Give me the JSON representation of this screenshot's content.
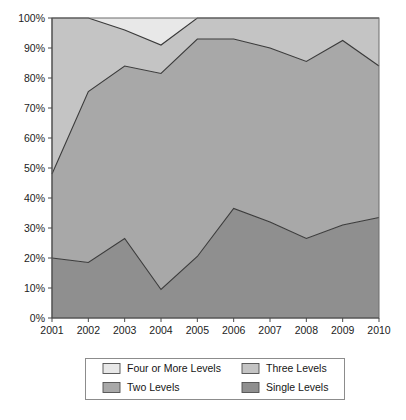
{
  "chart_data": {
    "type": "area",
    "stacked": true,
    "stack_mode": "percent",
    "title": "",
    "subtitle": "",
    "xlabel": "",
    "ylabel": "",
    "grid": false,
    "legend_position": "bottom",
    "categories": [
      "2001",
      "2002",
      "2003",
      "2004",
      "2005",
      "2006",
      "2007",
      "2008",
      "2009",
      "2010"
    ],
    "x_tick_labels": [
      "2001",
      "2002",
      "2003",
      "2004",
      "2005",
      "2006",
      "2007",
      "2008",
      "2009",
      "2010"
    ],
    "y_tick_labels": [
      "0%",
      "10%",
      "20%",
      "30%",
      "40%",
      "50%",
      "60%",
      "70%",
      "80%",
      "90%",
      "100%"
    ],
    "y_tick_values": [
      0,
      10,
      20,
      30,
      40,
      50,
      60,
      70,
      80,
      90,
      100
    ],
    "ylim": [
      0,
      100
    ],
    "y_unit": "%",
    "series": [
      {
        "name": "Single Levels",
        "color": "#8f8f8f",
        "values": [
          20.0,
          18.5,
          26.5,
          9.5,
          20.5,
          36.5,
          32.0,
          26.5,
          31.0,
          33.5
        ],
        "cumulative_top": [
          20.0,
          18.5,
          26.5,
          9.5,
          20.5,
          36.5,
          32.0,
          26.5,
          31.0,
          33.5
        ]
      },
      {
        "name": "Two Levels",
        "color": "#a8a8a8",
        "values": [
          28.0,
          57.0,
          57.5,
          72.0,
          72.5,
          56.5,
          58.0,
          59.0,
          61.5,
          50.5
        ],
        "cumulative_top": [
          48.0,
          75.5,
          84.0,
          81.5,
          93.0,
          93.0,
          90.0,
          85.5,
          92.5,
          84.0
        ]
      },
      {
        "name": "Three Levels",
        "color": "#c4c4c4",
        "values": [
          52.0,
          24.5,
          12.0,
          9.5,
          7.0,
          7.0,
          10.0,
          14.5,
          7.5,
          16.0
        ],
        "cumulative_top": [
          100.0,
          100.0,
          96.0,
          91.0,
          100.0,
          100.0,
          100.0,
          100.0,
          100.0,
          100.0
        ]
      },
      {
        "name": "Four or More Levels",
        "color": "#e8e8e8",
        "values": [
          0.0,
          0.0,
          4.0,
          9.0,
          0.0,
          0.0,
          0.0,
          0.0,
          0.0,
          0.0
        ],
        "cumulative_top": [
          100.0,
          100.0,
          100.0,
          100.0,
          100.0,
          100.0,
          100.0,
          100.0,
          100.0,
          100.0
        ]
      }
    ]
  },
  "legend": {
    "entries": [
      {
        "label": "Four or More Levels",
        "color": "#e8e8e8"
      },
      {
        "label": "Three Levels",
        "color": "#c4c4c4"
      },
      {
        "label": "Two Levels",
        "color": "#a8a8a8"
      },
      {
        "label": "Single Levels",
        "color": "#8f8f8f"
      }
    ]
  },
  "colors": {
    "axis": "#4a4a4a",
    "outline": "#3a3a3a",
    "plot_border": "#6d6d6d",
    "legend_border": "#8c8c8c",
    "background": "#ffffff"
  }
}
